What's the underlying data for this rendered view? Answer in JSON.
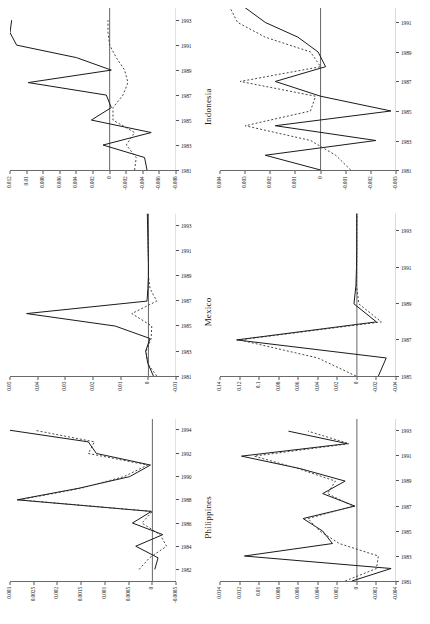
{
  "figure": {
    "orientation": "landscape-rotated",
    "rows": 2,
    "columns": 3,
    "solid_color": "#1a1a1a",
    "dotted_color": "#333333"
  },
  "chart_data": [
    {
      "id": "philippines-top",
      "type": "line",
      "title": "Philippines",
      "xlabel": "",
      "ylabel": "",
      "grid": false,
      "legend": "none",
      "xlim": [
        1981,
        1995
      ],
      "ylim": [
        -0.0005,
        0.003
      ],
      "xticks": [
        "1982",
        "1984",
        "1986",
        "1988",
        "1990",
        "1992",
        "1994"
      ],
      "xtick_values": [
        1982,
        1984,
        1986,
        1988,
        1990,
        1992,
        1994
      ],
      "yticks": [
        "0.003",
        "0.0025",
        "0.002",
        "0.0015",
        "0.001",
        "0.0005",
        "0",
        "-0.0005"
      ],
      "ytick_values": [
        0.003,
        0.0025,
        0.002,
        0.0015,
        0.001,
        0.0005,
        0,
        -0.0005
      ],
      "x": [
        1982,
        1983,
        1984,
        1985,
        1986,
        1987,
        1988,
        1989,
        1990,
        1991,
        1992,
        1993,
        1994
      ],
      "series": [
        {
          "name": "solid",
          "style": "solid",
          "values": [
            -5e-05,
            -0.00012,
            0.00035,
            -0.00022,
            0.00042,
            2e-05,
            0.00285,
            0.00155,
            0.00048,
            4e-05,
            0.00118,
            0.00135,
            0.003
          ]
        },
        {
          "name": "dotted",
          "style": "dotted",
          "values": [
            0.00028,
            6e-05,
            -0.0003,
            -0.00016,
            0.00022,
            0.0,
            0.0028,
            0.0015,
            0.0006,
            0.0001,
            0.00135,
            0.00122,
            0.00248
          ]
        }
      ]
    },
    {
      "id": "mexico-top",
      "type": "line",
      "title": "Mexico",
      "xlabel": "",
      "ylabel": "",
      "grid": false,
      "legend": "none",
      "xlim": [
        1981,
        1994
      ],
      "ylim": [
        -0.01,
        0.05
      ],
      "xticks": [
        "1981",
        "1983",
        "1985",
        "1987",
        "1989",
        "1991",
        "1993"
      ],
      "xtick_values": [
        1981,
        1983,
        1985,
        1987,
        1989,
        1991,
        1993
      ],
      "yticks": [
        "0.05",
        "0.04",
        "0.03",
        "0.02",
        "0.01",
        "0",
        "-0.01"
      ],
      "ytick_values": [
        0.05,
        0.04,
        0.03,
        0.02,
        0.01,
        0,
        -0.01
      ],
      "x": [
        1981,
        1982,
        1983,
        1984,
        1985,
        1986,
        1987,
        1988,
        1989,
        1990,
        1991,
        1992,
        1993,
        1994
      ],
      "series": [
        {
          "name": "solid",
          "style": "solid",
          "values": [
            -0.0018,
            0.0002,
            0.001,
            -0.0006,
            0.012,
            0.044,
            0.0005,
            0.0002,
            0.0,
            0.0,
            0.0001,
            0.0002,
            0.0003,
            0.0004
          ]
        },
        {
          "name": "dotted",
          "style": "dotted",
          "values": [
            -0.003,
            0.0003,
            0.0008,
            -0.001,
            -0.0012,
            0.006,
            -0.003,
            -0.0006,
            0.0,
            0.0,
            0.0001,
            0.0001,
            0.0002,
            0.0003
          ]
        }
      ]
    },
    {
      "id": "indonesia-top",
      "type": "line",
      "title": "Indonesia",
      "xlabel": "",
      "ylabel": "",
      "grid": false,
      "legend": "none",
      "xlim": [
        1981,
        1994
      ],
      "ylim": [
        -0.008,
        0.012
      ],
      "xticks": [
        "1981",
        "1983",
        "1985",
        "1987",
        "1989",
        "1991",
        "1993"
      ],
      "xtick_values": [
        1981,
        1983,
        1985,
        1987,
        1989,
        1991,
        1993
      ],
      "yticks": [
        "0.012",
        "0.01",
        "0.008",
        "0.006",
        "0.004",
        "0.002",
        "0",
        "-0.002",
        "-0.004",
        "-0.006",
        "-0.008"
      ],
      "ytick_values": [
        0.012,
        0.01,
        0.008,
        0.006,
        0.004,
        0.002,
        0,
        -0.002,
        -0.004,
        -0.006,
        -0.008
      ],
      "x": [
        1981,
        1982,
        1983,
        1984,
        1985,
        1986,
        1987,
        1988,
        1989,
        1990,
        1991,
        1992,
        1993
      ],
      "series": [
        {
          "name": "solid",
          "style": "solid",
          "values": [
            -0.0045,
            -0.0042,
            0.0008,
            -0.005,
            0.0022,
            -0.0002,
            0.0004,
            0.0098,
            -0.0002,
            0.004,
            0.0112,
            0.012,
            0.0118
          ]
        },
        {
          "name": "dotted",
          "style": "dotted",
          "values": [
            -0.003,
            -0.0032,
            -0.002,
            -0.003,
            -0.0004,
            -0.0004,
            -0.0016,
            -0.0022,
            -0.0018,
            -0.0008,
            0.0,
            0.0002,
            0.0002
          ]
        }
      ]
    },
    {
      "id": "philippines-bottom",
      "type": "line",
      "title": "",
      "xlabel": "",
      "ylabel": "",
      "grid": false,
      "legend": "none",
      "xlim": [
        1981,
        1994
      ],
      "ylim": [
        -0.004,
        0.014
      ],
      "xticks": [
        "1981",
        "1983",
        "1985",
        "1987",
        "1989",
        "1991",
        "1993"
      ],
      "xtick_values": [
        1981,
        1983,
        1985,
        1987,
        1989,
        1991,
        1993
      ],
      "yticks": [
        "0.014",
        "0.012",
        "0.01",
        "0.008",
        "0.006",
        "0.004",
        "0.002",
        "0",
        "-0.002",
        "-0.004"
      ],
      "ytick_values": [
        0.014,
        0.012,
        0.01,
        0.008,
        0.006,
        0.004,
        0.002,
        0,
        -0.002,
        -0.004
      ],
      "x": [
        1981,
        1982,
        1983,
        1984,
        1985,
        1986,
        1987,
        1988,
        1989,
        1990,
        1991,
        1992,
        1993
      ],
      "series": [
        {
          "name": "solid",
          "style": "solid",
          "values": [
            0.0005,
            -0.0035,
            0.0115,
            0.0025,
            0.0035,
            0.0055,
            0.0002,
            0.0035,
            0.0012,
            0.0058,
            0.0118,
            0.001,
            0.007
          ]
        },
        {
          "name": "dotted",
          "style": "dotted",
          "values": [
            0.0012,
            -0.002,
            -0.0022,
            0.0018,
            0.0038,
            0.005,
            0.0004,
            0.003,
            0.0022,
            0.006,
            0.0105,
            0.0008,
            0.005
          ]
        }
      ]
    },
    {
      "id": "mexico-bottom",
      "type": "line",
      "title": "",
      "xlabel": "",
      "ylabel": "",
      "grid": false,
      "legend": "none",
      "xlim": [
        1985,
        1994
      ],
      "ylim": [
        -0.04,
        0.14
      ],
      "xticks": [
        "1985",
        "1987",
        "1989",
        "1991",
        "1993"
      ],
      "xtick_values": [
        1985,
        1987,
        1989,
        1991,
        1993
      ],
      "yticks": [
        "0.14",
        "0.12",
        "0.1",
        "0.08",
        "0.06",
        "0.04",
        "0.02",
        "0",
        "-0.02",
        "-0.04"
      ],
      "ytick_values": [
        0.14,
        0.12,
        0.1,
        0.08,
        0.06,
        0.04,
        0.02,
        0,
        -0.02,
        -0.04
      ],
      "x": [
        1985,
        1986,
        1987,
        1988,
        1989,
        1990,
        1991,
        1992,
        1993,
        1994
      ],
      "series": [
        {
          "name": "solid",
          "style": "solid",
          "values": [
            -0.022,
            -0.03,
            0.123,
            -0.02,
            0.003,
            0.001,
            0.0004,
            0.0002,
            0.0002,
            0.0001
          ]
        },
        {
          "name": "dotted",
          "style": "dotted",
          "values": [
            0.001,
            0.04,
            0.12,
            -0.025,
            -0.002,
            0.0004,
            0.0002,
            0.0001,
            0.0001,
            0.0
          ]
        }
      ]
    },
    {
      "id": "indonesia-bottom",
      "type": "line",
      "title": "",
      "xlabel": "",
      "ylabel": "",
      "grid": false,
      "legend": "none",
      "xlim": [
        1981,
        1992
      ],
      "ylim": [
        -0.003,
        0.004
      ],
      "xticks": [
        "1981",
        "1983",
        "1985",
        "1987",
        "1989",
        "1991"
      ],
      "xtick_values": [
        1981,
        1983,
        1985,
        1987,
        1989,
        1991
      ],
      "yticks": [
        "0.004",
        "0.003",
        "0.002",
        "0.001",
        "0",
        "-0.001",
        "-0.002",
        "-0.003"
      ],
      "ytick_values": [
        0.004,
        0.003,
        0.002,
        0.001,
        0,
        -0.001,
        -0.002,
        -0.003
      ],
      "x": [
        1981,
        1982,
        1983,
        1984,
        1985,
        1986,
        1987,
        1988,
        1989,
        1990,
        1991,
        1992
      ],
      "series": [
        {
          "name": "solid",
          "style": "solid",
          "values": [
            0.0,
            0.0022,
            -0.0022,
            0.0018,
            -0.0028,
            0.0,
            0.0018,
            -0.0002,
            0.0001,
            0.0009,
            0.0022,
            0.003
          ]
        },
        {
          "name": "dotted",
          "style": "dotted",
          "values": [
            -0.0012,
            -0.0006,
            0.0004,
            0.003,
            0.0004,
            0.0002,
            0.0032,
            0.0,
            0.0004,
            0.0022,
            0.0033,
            0.0036
          ]
        }
      ]
    }
  ]
}
